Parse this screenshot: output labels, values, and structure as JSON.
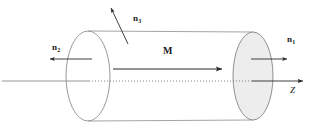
{
  "figure": {
    "background_color": "#ffffff",
    "stroke_color": "#8c8c8c",
    "arrow_color": "#2b2b2b",
    "text_color": "#1a1a1a",
    "end_face_fill": "#ededed"
  },
  "labels": {
    "magnetization": {
      "text": "M",
      "name": "magnetization-vector-label"
    },
    "normal_right": {
      "symbol": "n",
      "subscript": "1",
      "name": "normal-vector-n1-label"
    },
    "normal_left": {
      "symbol": "n",
      "subscript": "2",
      "name": "normal-vector-n2-label"
    },
    "normal_lateral": {
      "symbol": "n",
      "subscript": "3",
      "name": "normal-vector-n3-label"
    },
    "axis": {
      "text": "Z",
      "name": "z-axis-label"
    }
  },
  "geometry": {
    "left_face": {
      "cx": 88,
      "cy": 76,
      "rx": 22,
      "ry": 45
    },
    "right_face": {
      "cx": 253,
      "cy": 76,
      "rx": 20,
      "ry": 44
    },
    "body_top_y": 31,
    "body_bottom_y": 121,
    "axis_y": 81,
    "axis_start_x": 2,
    "axis_end_x": 305
  }
}
